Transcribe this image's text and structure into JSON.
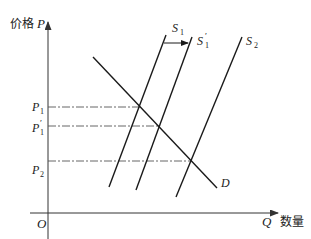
{
  "diagram": {
    "type": "supply-demand",
    "y_axis": {
      "label_cn": "价格",
      "label_var": "P"
    },
    "x_axis": {
      "label_var": "Q",
      "label_cn": "数量"
    },
    "origin": "O",
    "price_levels": [
      {
        "label": "P",
        "sub": "1",
        "prime": "",
        "y": 107
      },
      {
        "label": "P",
        "sub": "1",
        "prime": "′",
        "y": 126
      },
      {
        "label": "P",
        "sub": "2",
        "prime": "",
        "y": 161
      }
    ],
    "curves": {
      "S1": {
        "label": "S",
        "sub": "1",
        "prime": ""
      },
      "S1p": {
        "label": "S",
        "sub": "1",
        "prime": "′"
      },
      "S2": {
        "label": "S",
        "sub": "2",
        "prime": ""
      },
      "D": {
        "label": "D"
      }
    },
    "shift_arrow": {
      "from": "S1",
      "to": "S1′"
    }
  },
  "colors": {
    "line": "#1a1a1a",
    "dashed": "#555555",
    "axis": "#333333"
  }
}
